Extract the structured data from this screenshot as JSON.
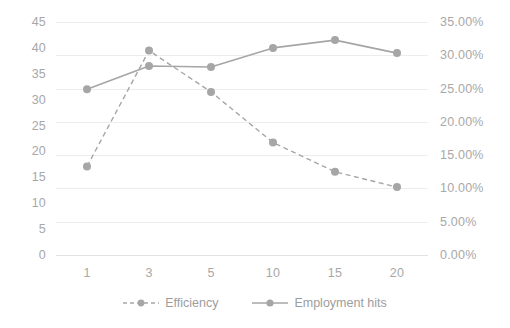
{
  "chart_data": {
    "type": "line",
    "title": "",
    "subtitle": "",
    "xlabel": "",
    "ylabel": "",
    "categories": [
      "1",
      "3",
      "5",
      "10",
      "15",
      "20"
    ],
    "grid": true,
    "legend_position": "bottom",
    "axes": {
      "left": {
        "name": "primary-value-axis",
        "min": 0,
        "max": 45,
        "step": 5,
        "ticks": [
          "0",
          "5",
          "10",
          "15",
          "20",
          "25",
          "30",
          "35",
          "40",
          "45"
        ],
        "tick_values": [
          0,
          5,
          10,
          15,
          20,
          25,
          30,
          35,
          40,
          45
        ]
      },
      "right": {
        "name": "secondary-percent-axis",
        "min": 0,
        "max": 0.35,
        "step": 0.05,
        "ticks": [
          "0.00%",
          "5.00%",
          "10.00%",
          "15.00%",
          "20.00%",
          "25.00%",
          "30.00%",
          "35.00%"
        ],
        "tick_values": [
          0,
          0.05,
          0.1,
          0.15,
          0.2,
          0.25,
          0.3,
          0.35
        ]
      }
    },
    "series": [
      {
        "name": "Efficiency",
        "axis": "right",
        "style": "dashed",
        "marker": "circle",
        "color": "#a6a6a6",
        "values": [
          0.133,
          0.307,
          0.245,
          0.169,
          0.125,
          0.102
        ],
        "value_labels": [
          "13.30%",
          "30.70%",
          "24.50%",
          "16.90%",
          "12.50%",
          "10.20%"
        ]
      },
      {
        "name": "Employment hits",
        "axis": "left",
        "style": "solid",
        "marker": "circle",
        "color": "#a6a6a6",
        "values": [
          32.0,
          36.5,
          36.3,
          40.0,
          41.5,
          39.0
        ],
        "value_labels": [
          "32.0",
          "36.5",
          "36.3",
          "40.0",
          "41.5",
          "39.0"
        ]
      }
    ]
  },
  "colors": {
    "series": "#a6a6a6",
    "gridline": "#ededed",
    "axis_text": "#a8a8a8",
    "legend_text": "#9d9d9d",
    "background": "#ffffff"
  },
  "legend": {
    "items": [
      {
        "label": "Efficiency",
        "icon": "dashed-line-marker-icon"
      },
      {
        "label": "Employment hits",
        "icon": "solid-line-marker-icon"
      }
    ]
  }
}
